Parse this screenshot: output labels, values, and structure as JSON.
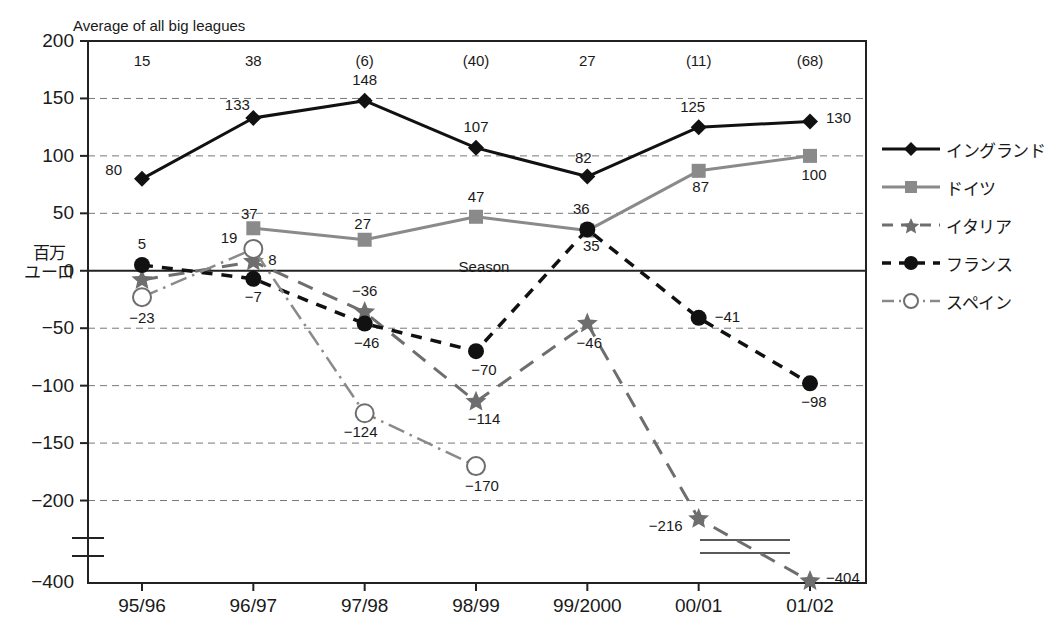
{
  "chart_title": "Average of all big leagues",
  "season_annotation": "Season",
  "axis": {
    "ylabel_line1": "百万",
    "ylabel_line2": "ユーロ",
    "yticks": [
      "200",
      "150",
      "100",
      "50",
      "0",
      "−50",
      "−100",
      "−150",
      "−200",
      "−400"
    ],
    "xticks": [
      "95/96",
      "96/97",
      "97/98",
      "98/99",
      "99/2000",
      "00/01",
      "01/02"
    ]
  },
  "top_row_values": [
    "15",
    "38",
    "(6)",
    "(40)",
    "27",
    "(11)",
    "(68)"
  ],
  "legend": {
    "items": [
      {
        "label": "イングランド",
        "marker": "diamond-marker",
        "color": "#111111",
        "dash": "solid"
      },
      {
        "label": "ドイツ",
        "marker": "square-marker",
        "color": "#8a8a8a",
        "dash": "solid"
      },
      {
        "label": "イタリア",
        "marker": "star-marker",
        "color": "#6e6e6e",
        "dash": "dashed"
      },
      {
        "label": "フランス",
        "marker": "circle-marker",
        "color": "#111111",
        "dash": "dashed"
      },
      {
        "label": "スペイン",
        "marker": "open-circle-marker",
        "color": "#8a8a8a",
        "dash": "dashdot"
      }
    ]
  },
  "chart_data": {
    "type": "line",
    "title": "Average of all big leagues",
    "xlabel": "Season",
    "ylabel": "百万ユーロ (million euros)",
    "ylim": [
      -230,
      200
    ],
    "broken_axis_below": -230,
    "grid": "horizontal-dashed",
    "legend_position": "right",
    "categories": [
      "95/96",
      "96/97",
      "97/98",
      "98/99",
      "99/2000",
      "00/01",
      "01/02"
    ],
    "top_row_label": "Average of all big leagues",
    "top_row_values": [
      15,
      38,
      -6,
      -40,
      27,
      -11,
      -68
    ],
    "series": [
      {
        "name": "イングランド",
        "name_en": "England",
        "values": [
          80,
          133,
          148,
          107,
          82,
          125,
          130
        ],
        "labels": [
          "80",
          "133",
          "148",
          "107",
          "82",
          "125",
          "130"
        ]
      },
      {
        "name": "ドイツ",
        "name_en": "Germany",
        "values": [
          null,
          37,
          27,
          47,
          35,
          87,
          100
        ],
        "labels": [
          null,
          "37",
          "27",
          "47",
          "35",
          "87",
          "100"
        ]
      },
      {
        "name": "イタリア",
        "name_en": "Italy",
        "values": [
          -8,
          8,
          -36,
          -114,
          -46,
          -216,
          -404
        ],
        "labels": [
          null,
          "8",
          "−36",
          "−114",
          "−46",
          "−216",
          "−404"
        ]
      },
      {
        "name": "フランス",
        "name_en": "France",
        "values": [
          5,
          -7,
          -46,
          -70,
          36,
          -41,
          -98
        ],
        "labels": [
          "5",
          "−7",
          "−46",
          "−70",
          "36",
          "−41",
          "−98"
        ]
      },
      {
        "name": "スペイン",
        "name_en": "Spain",
        "values": [
          -23,
          19,
          -124,
          -170,
          null,
          null,
          null
        ],
        "labels": [
          "−23",
          "19",
          "−124",
          "−170",
          null,
          null,
          null
        ]
      }
    ]
  }
}
